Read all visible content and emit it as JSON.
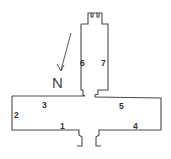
{
  "diagram": {
    "type": "floor-plan",
    "compass": {
      "label": "N"
    },
    "areas": [
      {
        "id": "1",
        "label": "1"
      },
      {
        "id": "2",
        "label": "2"
      },
      {
        "id": "3",
        "label": "3"
      },
      {
        "id": "4",
        "label": "4"
      },
      {
        "id": "5",
        "label": "5"
      },
      {
        "id": "6",
        "label": "6"
      },
      {
        "id": "7",
        "label": "7"
      }
    ]
  },
  "colors": {
    "line": "#4a4a4a",
    "background": "#ffffff"
  }
}
